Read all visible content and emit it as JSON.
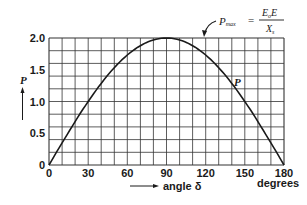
{
  "chart_data": {
    "type": "line",
    "title": "",
    "xlabel": "angle δ",
    "xunit": "degrees",
    "ylabel": "P",
    "xlim": [
      0,
      180
    ],
    "ylim": [
      0,
      2.0
    ],
    "x_ticks": [
      0,
      30,
      60,
      90,
      120,
      150,
      180
    ],
    "x_tick_labels": [
      "0",
      "30",
      "60",
      "90",
      "120",
      "150",
      "180"
    ],
    "y_ticks": [
      0,
      0.5,
      1.0,
      1.5,
      2.0
    ],
    "y_tick_labels": [
      "0",
      "0.5",
      "1.0",
      "1.5",
      "2.0"
    ],
    "grid": true,
    "grid_x_step": 10,
    "grid_y_step": 0.2,
    "legend": null,
    "series": [
      {
        "name": "P",
        "function": "P = Pmax · sin(δ)",
        "x": [
          0,
          10,
          20,
          30,
          40,
          50,
          60,
          70,
          80,
          90,
          100,
          110,
          120,
          130,
          140,
          150,
          160,
          170,
          180
        ],
        "values": [
          0,
          0.35,
          0.68,
          1.0,
          1.29,
          1.53,
          1.73,
          1.88,
          1.97,
          2.0,
          1.97,
          1.88,
          1.73,
          1.53,
          1.29,
          1.0,
          0.68,
          0.35,
          0
        ]
      }
    ],
    "annotations": [
      {
        "text": "P",
        "at": [
          143,
          1.32
        ],
        "role": "curve-label"
      },
      {
        "text": "Pmax = E0E / Xs",
        "at": [
          90,
          2.0
        ],
        "role": "peak-formula",
        "arrow": true
      }
    ]
  },
  "labels": {
    "y_axis": "P",
    "x_axis": "angle δ",
    "x_unit": "degrees",
    "curve": "P",
    "formula_lhs": "P",
    "formula_lhs_sub": "max",
    "formula_eq": "=",
    "formula_num": "E",
    "formula_num_sub": "o",
    "formula_num_tail": "E",
    "formula_den": "X",
    "formula_den_sub": "s"
  },
  "colors": {
    "ink": "#1a1a1a",
    "grid": "#333333",
    "background": "#ffffff"
  }
}
